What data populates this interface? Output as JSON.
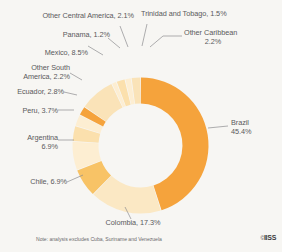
{
  "footnote": "Note: analysis excludes Cuba, Suriname and Venezuela",
  "logo": {
    "copyright": "©",
    "name": "IISS"
  },
  "colors": {
    "background": "#f7f6f3",
    "hole": "#ffffff",
    "strong_orange": "#f5a33c",
    "amber": "#f8c366",
    "light_cream": "#fae3b8",
    "pale_cream": "#fdeed2",
    "cream": "#fbe8c4",
    "leader_line": "#8d8d8f",
    "text": "#5a5a5c"
  },
  "chart_data": {
    "type": "pie",
    "variant": "donut",
    "title": "",
    "xlabel": "",
    "ylabel": "",
    "unit": "%",
    "note": "analysis excludes Cuba, Suriname and Venezuela",
    "start_angle_deg": -90,
    "direction": "clockwise",
    "categories": [
      "Brazil",
      "Colombia",
      "Chile",
      "Argentina",
      "Peru",
      "Ecuador",
      "Other South America",
      "Mexico",
      "Panama",
      "Other Central America",
      "Trinidad and Tobago",
      "Other Caribbean"
    ],
    "values": [
      45.4,
      17.3,
      6.9,
      6.9,
      3.7,
      2.8,
      2.2,
      8.5,
      1.2,
      2.1,
      1.5,
      2.2
    ],
    "slice_colors": [
      "#f5a33c",
      "#fbe8c4",
      "#f8c366",
      "#fdeed2",
      "#fbe0ad",
      "#fdeed2",
      "#f5a33c",
      "#fae3b8",
      "#fdeed2",
      "#fbe0ad",
      "#fdeed2",
      "#fae3b8"
    ],
    "slices": [
      {
        "label": "Brazil",
        "value": 45.4,
        "text": "Brazil\n45.4%",
        "color": "#f5a33c"
      },
      {
        "label": "Colombia",
        "value": 17.3,
        "text": "Colombia, 17.3%",
        "color": "#fbe8c4"
      },
      {
        "label": "Chile",
        "value": 6.9,
        "text": "Chile, 6.9%",
        "color": "#f8c366"
      },
      {
        "label": "Argentina",
        "value": 6.9,
        "text": "Argentina\n6.9%",
        "color": "#fdeed2"
      },
      {
        "label": "Peru",
        "value": 3.7,
        "text": "Peru, 3.7%",
        "color": "#fbe0ad"
      },
      {
        "label": "Ecuador",
        "value": 2.8,
        "text": "Ecuador, 2.8%",
        "color": "#fdeed2"
      },
      {
        "label": "Other South America",
        "value": 2.2,
        "text": "Other South\nAmerica, 2.2%",
        "color": "#f5a33c"
      },
      {
        "label": "Mexico",
        "value": 8.5,
        "text": "Mexico, 8.5%",
        "color": "#fae3b8"
      },
      {
        "label": "Panama",
        "value": 1.2,
        "text": "Panama, 1.2%",
        "color": "#fdeed2"
      },
      {
        "label": "Other Central America",
        "value": 2.1,
        "text": "Other Central America, 2.1%",
        "color": "#fbe0ad"
      },
      {
        "label": "Trinidad and Tobago",
        "value": 1.5,
        "text": "Trinidad and Tobago, 1.5%",
        "color": "#fdeed2"
      },
      {
        "label": "Other Caribbean",
        "value": 2.2,
        "text": "Other Caribbean\n2.2%",
        "color": "#fae3b8"
      }
    ],
    "legend": "none",
    "grid": false
  },
  "labels": {
    "other_central_america": "Other Central America, 2.1%",
    "panama": "Panama, 1.2%",
    "mexico": "Mexico, 8.5%",
    "other_south_america_l1": "Other South",
    "other_south_america_l2": "America, 2.2%",
    "ecuador": "Ecuador, 2.8%",
    "peru": "Peru, 3.7%",
    "argentina_l1": "Argentina",
    "argentina_l2": "6.9%",
    "chile": "Chile, 6.9%",
    "colombia": "Colombia, 17.3%",
    "brazil_l1": "Brazil",
    "brazil_l2": "45.4%",
    "trinidad": "Trinidad and Tobago, 1.5%",
    "other_caribbean_l1": "Other Caribbean",
    "other_caribbean_l2": "2.2%"
  }
}
